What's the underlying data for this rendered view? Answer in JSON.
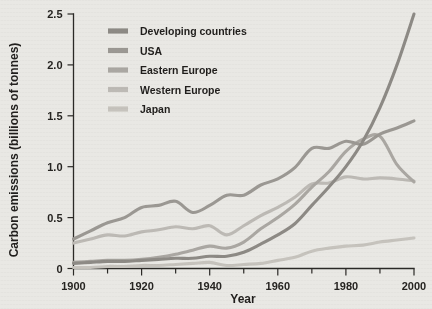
{
  "chart_data": {
    "type": "line",
    "title": "",
    "xlabel": "Year",
    "ylabel": "Carbon emissions (billions of tonnes)",
    "xlim": [
      1900,
      2000
    ],
    "ylim": [
      0,
      2.5
    ],
    "grid": false,
    "legend_position": "top-left-inside",
    "x_tick_labels": [
      "1900",
      "1920",
      "1940",
      "1960",
      "1980",
      "2000"
    ],
    "x_major_ticks": [
      1900,
      1920,
      1940,
      1960,
      1980,
      2000
    ],
    "x_minor_ticks": [
      1910,
      1930,
      1950,
      1970,
      1990
    ],
    "y_tick_labels": [
      "0",
      "0.5",
      "1.0",
      "1.5",
      "2.0",
      "2.5"
    ],
    "y_major_ticks": [
      0,
      0.5,
      1.0,
      1.5,
      2.0,
      2.5
    ],
    "x": [
      1900,
      1905,
      1910,
      1915,
      1920,
      1925,
      1930,
      1935,
      1940,
      1945,
      1950,
      1955,
      1960,
      1965,
      1970,
      1975,
      1980,
      1985,
      1990,
      1995,
      2000
    ],
    "series": [
      {
        "name": "Developing countries",
        "color": "#8d8a85",
        "values": [
          0.05,
          0.06,
          0.07,
          0.07,
          0.08,
          0.09,
          0.1,
          0.1,
          0.12,
          0.12,
          0.16,
          0.24,
          0.33,
          0.44,
          0.62,
          0.8,
          1.0,
          1.25,
          1.58,
          2.0,
          2.5
        ]
      },
      {
        "name": "USA",
        "color": "#9b9893"
      },
      {
        "name": "Eastern Europe",
        "color": "#aaa7a2"
      },
      {
        "name": "Western Europe",
        "color": "#bdbab5"
      },
      {
        "name": "Japan",
        "color": "#c6c3bd"
      }
    ],
    "series_values": {
      "Developing countries": [
        0.05,
        0.06,
        0.07,
        0.07,
        0.08,
        0.09,
        0.1,
        0.1,
        0.12,
        0.12,
        0.16,
        0.24,
        0.33,
        0.44,
        0.62,
        0.8,
        1.0,
        1.25,
        1.58,
        2.0,
        2.5
      ],
      "USA": [
        0.29,
        0.37,
        0.45,
        0.5,
        0.6,
        0.62,
        0.66,
        0.55,
        0.62,
        0.72,
        0.72,
        0.82,
        0.88,
        0.99,
        1.18,
        1.18,
        1.25,
        1.22,
        1.32,
        1.38,
        1.45
      ],
      "Eastern Europe": [
        0.06,
        0.07,
        0.08,
        0.08,
        0.09,
        0.11,
        0.14,
        0.18,
        0.22,
        0.2,
        0.26,
        0.39,
        0.5,
        0.63,
        0.8,
        0.95,
        1.15,
        1.27,
        1.3,
        1.02,
        0.85
      ],
      "Western Europe": [
        0.25,
        0.29,
        0.33,
        0.32,
        0.36,
        0.38,
        0.41,
        0.39,
        0.42,
        0.33,
        0.42,
        0.52,
        0.6,
        0.7,
        0.83,
        0.84,
        0.9,
        0.88,
        0.89,
        0.88,
        0.86
      ],
      "Japan": [
        0.01,
        0.01,
        0.02,
        0.02,
        0.03,
        0.03,
        0.04,
        0.05,
        0.06,
        0.03,
        0.04,
        0.05,
        0.08,
        0.11,
        0.17,
        0.2,
        0.22,
        0.23,
        0.26,
        0.28,
        0.3
      ]
    }
  },
  "legend": {
    "items": [
      {
        "label": "Developing countries",
        "color": "#8d8a85"
      },
      {
        "label": "USA",
        "color": "#9b9893"
      },
      {
        "label": "Eastern Europe",
        "color": "#aaa7a2"
      },
      {
        "label": "Western Europe",
        "color": "#bdbab5"
      },
      {
        "label": "Japan",
        "color": "#c6c3bd"
      }
    ]
  }
}
